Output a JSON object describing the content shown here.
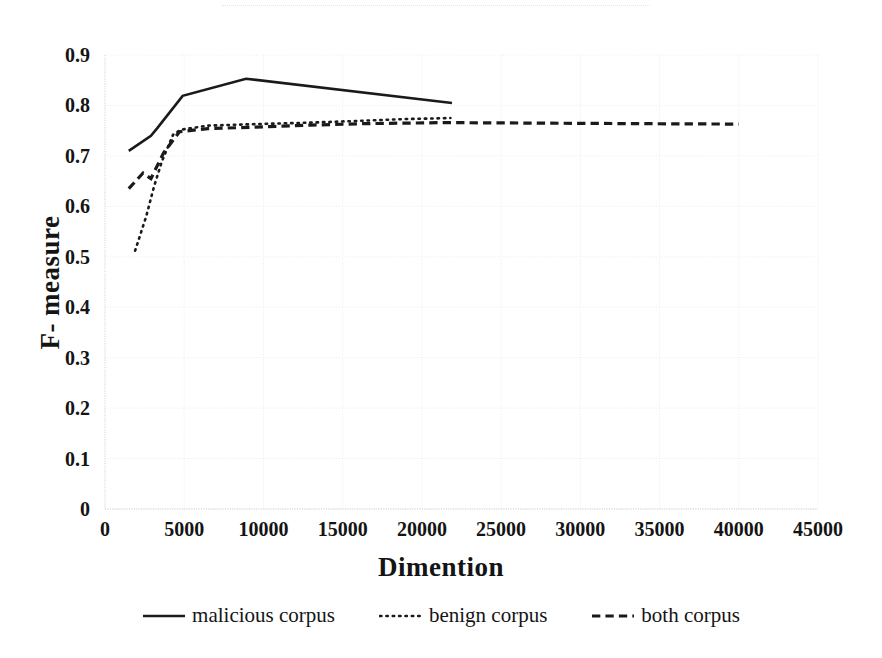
{
  "figure": {
    "background": "#ffffff",
    "ink_color": "#1a1a1a"
  },
  "chart_data": {
    "type": "line",
    "title": "",
    "xlabel": "Dimention",
    "ylabel": "F- measure",
    "xlim": [
      0,
      45000
    ],
    "ylim": [
      0,
      0.9
    ],
    "xticks": [
      "0",
      "5000",
      "10000",
      "15000",
      "20000",
      "25000",
      "30000",
      "35000",
      "40000",
      "45000"
    ],
    "xtick_values": [
      0,
      5000,
      10000,
      15000,
      20000,
      25000,
      30000,
      35000,
      40000,
      45000
    ],
    "yticks": [
      "0",
      "0.1",
      "0.2",
      "0.3",
      "0.4",
      "0.5",
      "0.6",
      "0.7",
      "0.8",
      "0.9"
    ],
    "ytick_values": [
      0,
      0.1,
      0.2,
      0.3,
      0.4,
      0.5,
      0.6,
      0.7,
      0.8,
      0.9
    ],
    "grid": true,
    "grid_color": "#ededf0",
    "legend_position": "bottom",
    "series": [
      {
        "name": "malicious corpus",
        "style": "solid",
        "color": "#1a1a1a",
        "width": 2.6,
        "x": [
          1500,
          2900,
          3300,
          4900,
          8900,
          21900
        ],
        "y": [
          0.71,
          0.74,
          0.755,
          0.819,
          0.853,
          0.805
        ]
      },
      {
        "name": "benign corpus",
        "style": "dotted",
        "color": "#1a1a1a",
        "width": 2.6,
        "x": [
          1900,
          2600,
          3100,
          3600,
          4300,
          4800,
          6500,
          9500,
          13000,
          16500,
          19000,
          21800
        ],
        "y": [
          0.512,
          0.58,
          0.64,
          0.69,
          0.742,
          0.752,
          0.76,
          0.763,
          0.766,
          0.77,
          0.773,
          0.775
        ]
      },
      {
        "name": "both corpus",
        "style": "dashed",
        "color": "#1a1a1a",
        "width": 3.2,
        "x": [
          1500,
          2400,
          2900,
          3700,
          4700,
          6500,
          9500,
          13000,
          16500,
          21500,
          27000,
          33000,
          40000
        ],
        "y": [
          0.635,
          0.666,
          0.655,
          0.706,
          0.748,
          0.754,
          0.757,
          0.761,
          0.764,
          0.766,
          0.765,
          0.764,
          0.763
        ]
      }
    ]
  },
  "legend": {
    "items": [
      {
        "label": "malicious corpus",
        "style": "solid",
        "color": "#1a1a1a"
      },
      {
        "label": "benign corpus",
        "style": "dotted",
        "color": "#1a1a1a"
      },
      {
        "label": "both corpus",
        "style": "dashed",
        "color": "#1a1a1a"
      }
    ]
  }
}
